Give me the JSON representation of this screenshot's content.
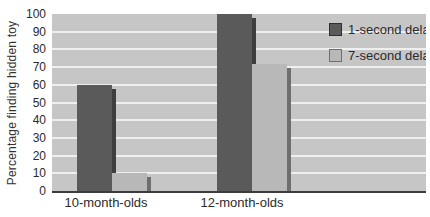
{
  "chart_data": {
    "type": "bar",
    "title": "",
    "xlabel": "",
    "ylabel": "Percentage finding hidden toy",
    "categories": [
      "10-month-olds",
      "12-month-olds"
    ],
    "series": [
      {
        "name": "1-second delay",
        "values": [
          60,
          100
        ],
        "color": "#5a5a5a",
        "shadow_color": "#3e3e3e",
        "swatch_border": "#2f2f2f"
      },
      {
        "name": "7-second delay",
        "values": [
          10,
          72
        ],
        "color": "#b8b8b8",
        "shadow_color": "#6e6e6e",
        "swatch_border": "#6f6f6f"
      }
    ],
    "ylim": [
      0,
      100
    ],
    "yticks": [
      0,
      10,
      20,
      30,
      40,
      50,
      60,
      70,
      80,
      90,
      100
    ],
    "grid": "horizontal-white-lines",
    "legend_position": "top-right-inside",
    "plot_bg": "#c6c6c6",
    "axis_color": "#3c3c3c"
  }
}
